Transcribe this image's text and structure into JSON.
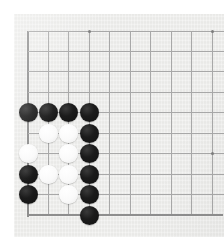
{
  "board": {
    "name": "go-board",
    "game": "Go",
    "background_color": "#ececea",
    "line_color": "#a8a8a8",
    "edge_color": "#8e8e8e",
    "black_stone_color": "#1b1b1b",
    "white_stone_color": "#fafafa",
    "stone_diameter": 19,
    "cell_size": 20.45,
    "origin_x": 28,
    "origin_y": 31,
    "columns_visible": 10,
    "rows_visible": 10,
    "left_edge_is_board_border": true,
    "bottom_edge_is_board_border": true,
    "corner_shown": "bottom-left",
    "grid_x": [
      28,
      48.4,
      68.9,
      89.3,
      109.8,
      130.2,
      150.7,
      171.1,
      191.6,
      212
    ],
    "grid_y": [
      31,
      51.4,
      71.9,
      92.3,
      112.8,
      133.2,
      153.7,
      174.1,
      194.6,
      215
    ],
    "star_points": [
      {
        "name": "star-point-top-left",
        "col": 4,
        "row": 1
      },
      {
        "name": "star-point-top-right",
        "col": 10,
        "row": 1
      },
      {
        "name": "star-point-center-right",
        "col": 10,
        "row": 7
      }
    ],
    "stones": [
      {
        "name": "stone-black-c1-r5",
        "color": "black",
        "col": 1,
        "row": 5
      },
      {
        "name": "stone-black-c2-r5",
        "color": "black",
        "col": 2,
        "row": 5
      },
      {
        "name": "stone-black-c3-r5",
        "color": "black",
        "col": 3,
        "row": 5
      },
      {
        "name": "stone-black-c4-r5",
        "color": "black",
        "col": 4,
        "row": 5
      },
      {
        "name": "stone-white-c2-r6",
        "color": "white",
        "col": 2,
        "row": 6
      },
      {
        "name": "stone-white-c3-r6",
        "color": "white",
        "col": 3,
        "row": 6
      },
      {
        "name": "stone-black-c4-r6",
        "color": "black",
        "col": 4,
        "row": 6
      },
      {
        "name": "stone-white-c1-r7",
        "color": "white",
        "col": 1,
        "row": 7
      },
      {
        "name": "stone-white-c3-r7",
        "color": "white",
        "col": 3,
        "row": 7
      },
      {
        "name": "stone-black-c4-r7",
        "color": "black",
        "col": 4,
        "row": 7
      },
      {
        "name": "stone-black-c1-r8",
        "color": "black",
        "col": 1,
        "row": 8
      },
      {
        "name": "stone-white-c2-r8",
        "color": "white",
        "col": 2,
        "row": 8
      },
      {
        "name": "stone-white-c3-r8",
        "color": "white",
        "col": 3,
        "row": 8
      },
      {
        "name": "stone-black-c4-r8",
        "color": "black",
        "col": 4,
        "row": 8
      },
      {
        "name": "stone-black-c1-r9",
        "color": "black",
        "col": 1,
        "row": 9
      },
      {
        "name": "stone-white-c3-r9",
        "color": "white",
        "col": 3,
        "row": 9
      },
      {
        "name": "stone-black-c4-r9",
        "color": "black",
        "col": 4,
        "row": 9
      },
      {
        "name": "stone-black-c4-r10",
        "color": "black",
        "col": 4,
        "row": 10
      }
    ],
    "counts": {
      "black_stones": 11,
      "white_stones": 7,
      "total_stones": 18
    }
  }
}
